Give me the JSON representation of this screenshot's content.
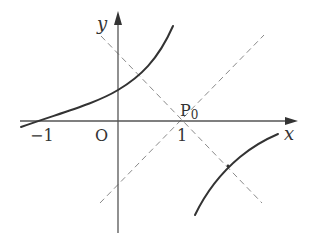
{
  "diagram": {
    "type": "coordinate-plot",
    "axes": {
      "x_label": "x",
      "y_label": "y",
      "origin_label": "O"
    },
    "ticks": {
      "neg_one": "−1",
      "one": "1"
    },
    "points": {
      "p0_label_main": "P",
      "p0_label_sub": "0",
      "p0_coords": [
        1,
        0
      ]
    },
    "curves": [
      {
        "name": "upper-left-branch",
        "passes_through": [
          [
            -1,
            0
          ]
        ],
        "style": "solid"
      },
      {
        "name": "lower-right-branch",
        "style": "solid"
      }
    ],
    "lines": [
      {
        "name": "dashed-line-descending",
        "through": [
          1,
          0
        ],
        "slope": -1,
        "style": "dashed"
      },
      {
        "name": "dashed-line-ascending",
        "through": [
          1,
          0
        ],
        "slope": 1,
        "style": "dashed"
      }
    ],
    "colors": {
      "curve": "#333333",
      "axis": "#555555",
      "dashed": "#8a8a8a",
      "background": "#ffffff"
    }
  }
}
